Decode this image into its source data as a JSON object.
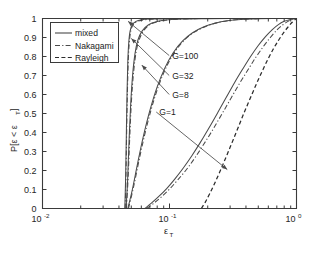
{
  "chart_data": {
    "type": "line",
    "title": "",
    "xlabel": "ε_T",
    "ylabel": "P[ε < ε_T]",
    "xscale": "log",
    "xlim": [
      0.01,
      1.0
    ],
    "ylim": [
      0,
      1
    ],
    "grid": false,
    "legend_position": "upper-left",
    "xticklabels": [
      "10⁻²",
      "10⁻¹",
      "10⁰"
    ],
    "xtick_bases": [
      "10",
      "10",
      "10"
    ],
    "xtick_exponents": [
      "-2",
      "-1",
      "0"
    ],
    "yticklabels": [
      "0",
      "0.1",
      "0.2",
      "0.3",
      "0.4",
      "0.5",
      "0.6",
      "0.7",
      "0.8",
      "0.9",
      "1"
    ],
    "ytickvalues": [
      0,
      0.1,
      0.2,
      0.3,
      0.4,
      0.5,
      0.6,
      0.7,
      0.8,
      0.9,
      1
    ],
    "legend": [
      {
        "label": "mixed",
        "style": "solid"
      },
      {
        "label": "Nakagami",
        "style": "dashdot"
      },
      {
        "label": "Rayleigh",
        "style": "dashed"
      }
    ],
    "annotations": [
      {
        "text": "G=100",
        "x": 0.105,
        "y": 0.805
      },
      {
        "text": "G=32",
        "x": 0.105,
        "y": 0.7
      },
      {
        "text": "G=8",
        "x": 0.105,
        "y": 0.6
      },
      {
        "text": "G=1",
        "x": 0.083,
        "y": 0.508
      }
    ],
    "series": [
      {
        "name": "mixed G=100",
        "style": "solid",
        "points": [
          [
            0.0445,
            0.0
          ],
          [
            0.0452,
            0.18
          ],
          [
            0.0458,
            0.42
          ],
          [
            0.0464,
            0.63
          ],
          [
            0.047,
            0.78
          ],
          [
            0.0478,
            0.875
          ],
          [
            0.049,
            0.935
          ],
          [
            0.051,
            0.968
          ],
          [
            0.0545,
            0.985
          ],
          [
            0.06,
            0.993
          ],
          [
            0.07,
            0.997
          ],
          [
            0.09,
            0.999
          ],
          [
            0.15,
            1.0
          ],
          [
            0.4,
            1.0
          ],
          [
            1.0,
            1.0
          ]
        ]
      },
      {
        "name": "Nakagami G=100",
        "style": "dashdot",
        "points": [
          [
            0.0448,
            0.0
          ],
          [
            0.0455,
            0.2
          ],
          [
            0.0461,
            0.45
          ],
          [
            0.0468,
            0.66
          ],
          [
            0.0475,
            0.8
          ],
          [
            0.0485,
            0.89
          ],
          [
            0.05,
            0.945
          ],
          [
            0.0525,
            0.972
          ],
          [
            0.057,
            0.987
          ],
          [
            0.065,
            0.994
          ],
          [
            0.08,
            0.998
          ],
          [
            0.12,
            1.0
          ],
          [
            0.4,
            1.0
          ],
          [
            1.0,
            1.0
          ]
        ]
      },
      {
        "name": "mixed G=32",
        "style": "solid",
        "points": [
          [
            0.0455,
            0.0
          ],
          [
            0.0468,
            0.15
          ],
          [
            0.048,
            0.35
          ],
          [
            0.0495,
            0.55
          ],
          [
            0.0512,
            0.7
          ],
          [
            0.0535,
            0.815
          ],
          [
            0.0565,
            0.888
          ],
          [
            0.061,
            0.935
          ],
          [
            0.068,
            0.966
          ],
          [
            0.08,
            0.984
          ],
          [
            0.098,
            0.993
          ],
          [
            0.125,
            0.997
          ],
          [
            0.18,
            0.999
          ],
          [
            0.3,
            1.0
          ],
          [
            1.0,
            1.0
          ]
        ]
      },
      {
        "name": "Nakagami G=32",
        "style": "dashdot",
        "points": [
          [
            0.0458,
            0.0
          ],
          [
            0.0472,
            0.16
          ],
          [
            0.0486,
            0.37
          ],
          [
            0.0502,
            0.57
          ],
          [
            0.0522,
            0.72
          ],
          [
            0.0548,
            0.83
          ],
          [
            0.0582,
            0.895
          ],
          [
            0.0632,
            0.94
          ],
          [
            0.071,
            0.97
          ],
          [
            0.084,
            0.986
          ],
          [
            0.104,
            0.994
          ],
          [
            0.135,
            0.998
          ],
          [
            0.2,
            1.0
          ],
          [
            1.0,
            1.0
          ]
        ]
      },
      {
        "name": "mixed G=8",
        "style": "solid",
        "points": [
          [
            0.047,
            0.0
          ],
          [
            0.051,
            0.1
          ],
          [
            0.056,
            0.235
          ],
          [
            0.062,
            0.375
          ],
          [
            0.07,
            0.515
          ],
          [
            0.08,
            0.64
          ],
          [
            0.092,
            0.74
          ],
          [
            0.107,
            0.82
          ],
          [
            0.127,
            0.882
          ],
          [
            0.152,
            0.925
          ],
          [
            0.185,
            0.955
          ],
          [
            0.228,
            0.975
          ],
          [
            0.285,
            0.988
          ],
          [
            0.365,
            0.995
          ],
          [
            0.48,
            0.998
          ],
          [
            0.65,
            1.0
          ],
          [
            1.0,
            1.0
          ]
        ]
      },
      {
        "name": "Nakagami G=8",
        "style": "dashdot",
        "points": [
          [
            0.0475,
            0.0
          ],
          [
            0.0518,
            0.105
          ],
          [
            0.0572,
            0.245
          ],
          [
            0.0636,
            0.385
          ],
          [
            0.072,
            0.525
          ],
          [
            0.0825,
            0.65
          ],
          [
            0.095,
            0.748
          ],
          [
            0.1105,
            0.826
          ],
          [
            0.131,
            0.886
          ],
          [
            0.157,
            0.928
          ],
          [
            0.191,
            0.957
          ],
          [
            0.235,
            0.977
          ],
          [
            0.293,
            0.989
          ],
          [
            0.375,
            0.996
          ],
          [
            0.49,
            0.999
          ],
          [
            0.66,
            1.0
          ],
          [
            1.0,
            1.0
          ]
        ]
      },
      {
        "name": "mixed G=1",
        "style": "solid",
        "points": [
          [
            0.064,
            0.0
          ],
          [
            0.072,
            0.028
          ],
          [
            0.082,
            0.062
          ],
          [
            0.095,
            0.105
          ],
          [
            0.11,
            0.155
          ],
          [
            0.128,
            0.212
          ],
          [
            0.15,
            0.278
          ],
          [
            0.175,
            0.348
          ],
          [
            0.205,
            0.425
          ],
          [
            0.24,
            0.505
          ],
          [
            0.28,
            0.585
          ],
          [
            0.325,
            0.662
          ],
          [
            0.378,
            0.735
          ],
          [
            0.435,
            0.8
          ],
          [
            0.5,
            0.858
          ],
          [
            0.57,
            0.905
          ],
          [
            0.645,
            0.942
          ],
          [
            0.72,
            0.968
          ],
          [
            0.8,
            0.985
          ],
          [
            0.88,
            0.994
          ],
          [
            0.95,
            0.998
          ],
          [
            1.0,
            1.0
          ]
        ]
      },
      {
        "name": "Nakagami G=1",
        "style": "dashdot",
        "points": [
          [
            0.066,
            0.0
          ],
          [
            0.075,
            0.027
          ],
          [
            0.086,
            0.06
          ],
          [
            0.1,
            0.102
          ],
          [
            0.116,
            0.15
          ],
          [
            0.136,
            0.205
          ],
          [
            0.159,
            0.268
          ],
          [
            0.186,
            0.338
          ],
          [
            0.218,
            0.412
          ],
          [
            0.256,
            0.492
          ],
          [
            0.3,
            0.572
          ],
          [
            0.35,
            0.65
          ],
          [
            0.408,
            0.722
          ],
          [
            0.472,
            0.79
          ],
          [
            0.545,
            0.85
          ],
          [
            0.622,
            0.9
          ],
          [
            0.702,
            0.94
          ],
          [
            0.782,
            0.967
          ],
          [
            0.858,
            0.985
          ],
          [
            0.925,
            0.995
          ],
          [
            1.0,
            1.0
          ]
        ]
      },
      {
        "name": "Rayleigh G=1",
        "style": "dashed",
        "points": [
          [
            0.178,
            0.0
          ],
          [
            0.192,
            0.035
          ],
          [
            0.208,
            0.08
          ],
          [
            0.226,
            0.13
          ],
          [
            0.246,
            0.185
          ],
          [
            0.268,
            0.243
          ],
          [
            0.292,
            0.303
          ],
          [
            0.318,
            0.363
          ],
          [
            0.348,
            0.428
          ],
          [
            0.38,
            0.492
          ],
          [
            0.415,
            0.552
          ],
          [
            0.455,
            0.615
          ],
          [
            0.498,
            0.675
          ],
          [
            0.545,
            0.732
          ],
          [
            0.598,
            0.788
          ],
          [
            0.655,
            0.838
          ],
          [
            0.718,
            0.883
          ],
          [
            0.785,
            0.922
          ],
          [
            0.855,
            0.954
          ],
          [
            0.925,
            0.98
          ],
          [
            1.0,
            1.0
          ]
        ]
      }
    ]
  },
  "figure": {
    "background": "#ffffff",
    "axis_color": "#3a3a3a",
    "curve_color": "#4a4a4a"
  }
}
